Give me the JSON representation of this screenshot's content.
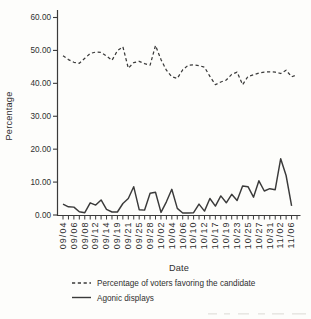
{
  "figure": {
    "background": "#fdfdfb",
    "ink": "#3a3a3a",
    "text_color": "#2f2f2f"
  },
  "chart_data": {
    "type": "line",
    "title": "",
    "xlabel": "Date",
    "ylabel": "Percentage",
    "ylim": [
      0,
      60
    ],
    "grid": false,
    "legend_position": "bottom-left",
    "y_tick_values": [
      0,
      10,
      20,
      30,
      40,
      50,
      60
    ],
    "y_tick_labels": [
      "0.00",
      "10.00",
      "20.00",
      "30.00",
      "40.00",
      "50.00",
      "60.00"
    ],
    "n_x_ticks": 44,
    "x_label_every_n_ticks": 2,
    "x_tick_labels": [
      "09/04",
      "09/06",
      "09/08",
      "09/12",
      "09/14",
      "09/19",
      "09/21",
      "09/25",
      "09/28",
      "10/02",
      "10/04",
      "10/06",
      "10/10",
      "10/12",
      "10/17",
      "10/19",
      "10/23",
      "10/25",
      "10/27",
      "10/31",
      "11/02",
      "11/06"
    ],
    "series": [
      {
        "name": "Percentage of voters favoring the candidate",
        "line_style": "dashed",
        "values": [
          48.4,
          47.2,
          46.4,
          46.1,
          47.6,
          49.1,
          49.5,
          49.4,
          48.3,
          47.0,
          49.9,
          51.1,
          44.6,
          46.3,
          46.7,
          46.0,
          45.5,
          51.5,
          47.2,
          44.0,
          42.0,
          41.5,
          44.1,
          45.5,
          45.6,
          45.4,
          44.9,
          42.1,
          39.6,
          40.4,
          41.0,
          42.7,
          43.4,
          39.6,
          42.1,
          42.6,
          43.1,
          43.4,
          43.5,
          43.4,
          43.0,
          44.0,
          42.0,
          42.6
        ]
      },
      {
        "name": "Agonic displays",
        "line_style": "solid",
        "values": [
          3.3,
          2.5,
          2.4,
          1.0,
          0.7,
          3.7,
          3.0,
          4.6,
          1.7,
          0.9,
          0.9,
          3.5,
          5.0,
          8.6,
          1.6,
          1.5,
          6.6,
          6.9,
          0.8,
          4.0,
          7.8,
          2.0,
          0.6,
          0.6,
          0.7,
          3.3,
          1.2,
          5.0,
          2.7,
          5.8,
          3.7,
          6.3,
          4.4,
          8.8,
          8.6,
          5.4,
          10.4,
          7.3,
          8.0,
          7.7,
          17.1,
          12.0,
          2.8
        ]
      }
    ]
  }
}
